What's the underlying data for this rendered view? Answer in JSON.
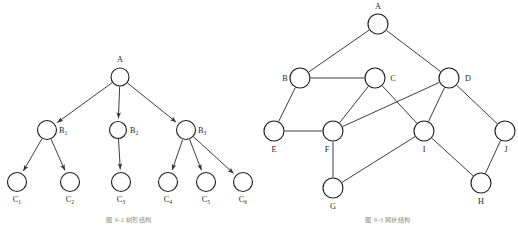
{
  "figure": {
    "background_color": "#ffffff",
    "ink_color": "#333333",
    "panels": [
      {
        "id": "tree",
        "kind": "directed-tree",
        "caption": "图 9-2  树形结构",
        "nodes": [
          {
            "id": "A",
            "label": "A",
            "sub": "",
            "x": 120,
            "y": 77,
            "r": 9,
            "label_x": 120,
            "label_y": 62,
            "label_anchor": "middle"
          },
          {
            "id": "B1",
            "label": "B",
            "sub": "1",
            "x": 47,
            "y": 130,
            "r": 9.5,
            "label_x": 59,
            "label_y": 133,
            "label_anchor": "start"
          },
          {
            "id": "B2",
            "label": "B",
            "sub": "2",
            "x": 118,
            "y": 130,
            "r": 8.5,
            "label_x": 130,
            "label_y": 133,
            "label_anchor": "start"
          },
          {
            "id": "B3",
            "label": "B",
            "sub": "3",
            "x": 186,
            "y": 130,
            "r": 9.5,
            "label_x": 198,
            "label_y": 133,
            "label_anchor": "start"
          },
          {
            "id": "C1",
            "label": "C",
            "sub": "1",
            "x": 17,
            "y": 182,
            "r": 9.5,
            "label_x": 17,
            "label_y": 202,
            "label_anchor": "middle"
          },
          {
            "id": "C2",
            "label": "C",
            "sub": "2",
            "x": 70,
            "y": 182,
            "r": 9.5,
            "label_x": 70,
            "label_y": 202,
            "label_anchor": "middle"
          },
          {
            "id": "C3",
            "label": "C",
            "sub": "3",
            "x": 121,
            "y": 182,
            "r": 9.5,
            "label_x": 121,
            "label_y": 202,
            "label_anchor": "middle"
          },
          {
            "id": "C4",
            "label": "C",
            "sub": "4",
            "x": 168,
            "y": 182,
            "r": 9.5,
            "label_x": 168,
            "label_y": 202,
            "label_anchor": "middle"
          },
          {
            "id": "C5",
            "label": "C",
            "sub": "5",
            "x": 206,
            "y": 182,
            "r": 9.5,
            "label_x": 206,
            "label_y": 202,
            "label_anchor": "middle"
          },
          {
            "id": "C6",
            "label": "C",
            "sub": "6",
            "x": 243,
            "y": 182,
            "r": 9.5,
            "label_x": 243,
            "label_y": 202,
            "label_anchor": "middle"
          }
        ],
        "edges": [
          {
            "from": "A",
            "to": "B1",
            "directed": true
          },
          {
            "from": "A",
            "to": "B2",
            "directed": true
          },
          {
            "from": "A",
            "to": "B3",
            "directed": true
          },
          {
            "from": "B1",
            "to": "C1",
            "directed": true
          },
          {
            "from": "B1",
            "to": "C2",
            "directed": true
          },
          {
            "from": "B2",
            "to": "C3",
            "directed": true
          },
          {
            "from": "B3",
            "to": "C4",
            "directed": true
          },
          {
            "from": "B3",
            "to": "C5",
            "directed": true
          },
          {
            "from": "B3",
            "to": "C6",
            "directed": true
          }
        ]
      },
      {
        "id": "graph",
        "kind": "undirected-graph",
        "caption": "图 9-3  网状结构",
        "nodes": [
          {
            "id": "A",
            "label": "A",
            "sub": "",
            "x": 119,
            "y": 24,
            "r": 10,
            "label_x": 119,
            "label_y": 9,
            "label_anchor": "middle"
          },
          {
            "id": "B",
            "label": "B",
            "sub": "",
            "x": 41,
            "y": 78,
            "r": 10,
            "label_x": 26,
            "label_y": 81,
            "label_anchor": "middle"
          },
          {
            "id": "C",
            "label": "C",
            "sub": "",
            "x": 116,
            "y": 78,
            "r": 10,
            "label_x": 134,
            "label_y": 81,
            "label_anchor": "middle"
          },
          {
            "id": "D",
            "label": "D",
            "sub": "",
            "x": 190,
            "y": 78,
            "r": 10,
            "label_x": 209,
            "label_y": 81,
            "label_anchor": "middle"
          },
          {
            "id": "E",
            "label": "E",
            "sub": "",
            "x": 15,
            "y": 131,
            "r": 10,
            "label_x": 15,
            "label_y": 152,
            "label_anchor": "middle"
          },
          {
            "id": "F",
            "label": "F",
            "sub": "",
            "x": 74,
            "y": 131,
            "r": 10,
            "label_x": 68,
            "label_y": 152,
            "label_anchor": "middle"
          },
          {
            "id": "G",
            "label": "G",
            "sub": "",
            "x": 74,
            "y": 188,
            "r": 10,
            "label_x": 74,
            "label_y": 209,
            "label_anchor": "middle"
          },
          {
            "id": "I",
            "label": "I",
            "sub": "",
            "x": 165,
            "y": 131,
            "r": 10,
            "label_x": 165,
            "label_y": 152,
            "label_anchor": "middle"
          },
          {
            "id": "H",
            "label": "H",
            "sub": "",
            "x": 222,
            "y": 183,
            "r": 10,
            "label_x": 222,
            "label_y": 204,
            "label_anchor": "middle"
          },
          {
            "id": "J",
            "label": "J",
            "sub": "",
            "x": 246,
            "y": 131,
            "r": 10,
            "label_x": 247,
            "label_y": 152,
            "label_anchor": "middle"
          }
        ],
        "edges": [
          {
            "from": "A",
            "to": "B",
            "directed": false
          },
          {
            "from": "A",
            "to": "D",
            "directed": false
          },
          {
            "from": "B",
            "to": "C",
            "directed": false
          },
          {
            "from": "B",
            "to": "E",
            "directed": false
          },
          {
            "from": "C",
            "to": "F",
            "directed": false
          },
          {
            "from": "C",
            "to": "I",
            "directed": false
          },
          {
            "from": "D",
            "to": "F",
            "directed": false
          },
          {
            "from": "D",
            "to": "I",
            "directed": false
          },
          {
            "from": "D",
            "to": "J",
            "directed": false
          },
          {
            "from": "E",
            "to": "F",
            "directed": false
          },
          {
            "from": "F",
            "to": "G",
            "directed": false
          },
          {
            "from": "G",
            "to": "I",
            "directed": false
          },
          {
            "from": "I",
            "to": "H",
            "directed": false
          },
          {
            "from": "H",
            "to": "J",
            "directed": false
          }
        ]
      }
    ]
  }
}
